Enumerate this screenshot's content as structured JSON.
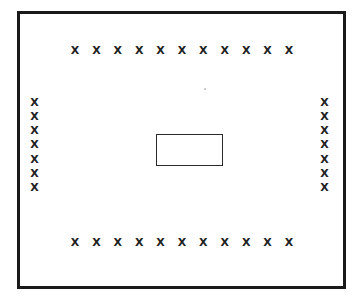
{
  "diagram": {
    "background_color": "#ffffff",
    "line_color": "#1a1a1a",
    "marker_glyph": "X",
    "marker_color": "#222222",
    "outer_frame": {
      "label": "outer boundary rectangle",
      "border_width_px": 3,
      "x": 17,
      "y": 11,
      "width": 329,
      "height": 278
    },
    "center_rectangle": {
      "label": "center rectangle",
      "border_width_px": 1.5,
      "x": 156,
      "y": 134,
      "width": 67,
      "height": 32,
      "contents": ""
    },
    "marker_groups": [
      {
        "name": "top-row",
        "orientation": "horizontal",
        "count": 11,
        "markers": [
          "X",
          "X",
          "X",
          "X",
          "X",
          "X",
          "X",
          "X",
          "X",
          "X",
          "X"
        ]
      },
      {
        "name": "bottom-row",
        "orientation": "horizontal",
        "count": 11,
        "markers": [
          "X",
          "X",
          "X",
          "X",
          "X",
          "X",
          "X",
          "X",
          "X",
          "X",
          "X"
        ]
      },
      {
        "name": "left-column",
        "orientation": "vertical",
        "count": 7,
        "markers": [
          "X",
          "X",
          "X",
          "X",
          "X",
          "X",
          "X"
        ]
      },
      {
        "name": "right-column",
        "orientation": "vertical",
        "count": 7,
        "markers": [
          "X",
          "X",
          "X",
          "X",
          "X",
          "X",
          "X"
        ]
      }
    ],
    "total_marker_count": 36
  }
}
